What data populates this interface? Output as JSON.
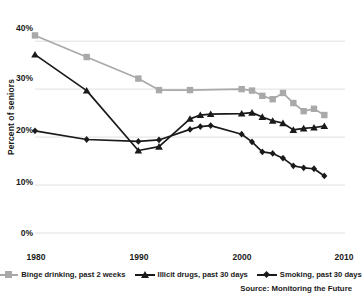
{
  "chart_data": {
    "type": "line",
    "title": "",
    "subtitle": "",
    "xlabel": "",
    "ylabel": "Percent of seniors",
    "xlim": [
      1980,
      2010
    ],
    "ylim": [
      0,
      44
    ],
    "xticks": [
      1980,
      1990,
      2000,
      2010
    ],
    "xtick_labels": [
      "1980",
      "1990",
      "2000",
      "2010"
    ],
    "yticks": [
      0,
      10,
      20,
      30,
      40
    ],
    "ytick_labels": [
      "0%",
      "10%",
      "20%",
      "30%",
      "40%"
    ],
    "grid": true,
    "grid_axis": "y",
    "legend_position": "bottom",
    "source": "Source: Monitoring the Future",
    "series": [
      {
        "name": "Binge drinking, past 2 weeks",
        "color": "#a9a9a9",
        "marker": "square",
        "x": [
          1980,
          1985,
          1990,
          1992,
          1995,
          2000,
          2001,
          2002,
          2003,
          2004,
          2005,
          2006,
          2007,
          2008
        ],
        "values": [
          41.2,
          36.7,
          32.2,
          29.8,
          29.8,
          30.0,
          29.7,
          28.6,
          27.9,
          29.2,
          27.1,
          25.4,
          25.9,
          24.6
        ]
      },
      {
        "name": "Illicit drugs, past 30 days",
        "color": "#1a1a1a",
        "marker": "triangle",
        "x": [
          1980,
          1985,
          1990,
          1992,
          1995,
          1996,
          1997,
          2000,
          2001,
          2002,
          2003,
          2004,
          2005,
          2006,
          2007,
          2008
        ],
        "values": [
          37.2,
          29.7,
          17.2,
          18.0,
          23.8,
          24.6,
          24.8,
          24.9,
          25.1,
          24.2,
          23.4,
          22.9,
          21.5,
          21.8,
          22.0,
          22.3
        ]
      },
      {
        "name": "Smoking, past 30 days",
        "color": "#1a1a1a",
        "marker": "diamond",
        "x": [
          1980,
          1985,
          1990,
          1992,
          1995,
          1996,
          1997,
          2000,
          2001,
          2002,
          2003,
          2004,
          2005,
          2006,
          2007,
          2008
        ],
        "values": [
          21.3,
          19.5,
          19.1,
          19.4,
          21.6,
          22.2,
          22.4,
          20.6,
          19.0,
          16.9,
          16.6,
          15.6,
          14.0,
          13.6,
          13.4,
          11.9
        ]
      }
    ]
  }
}
